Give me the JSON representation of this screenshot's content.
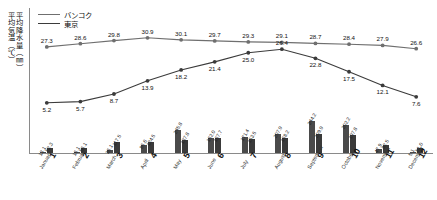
{
  "axis_titles": {
    "temperature": "平均気温（℃）",
    "precipitation": "平均降水量（㎜）"
  },
  "legend": {
    "items": [
      {
        "label": "バンコク",
        "color": "#6f6f6f"
      },
      {
        "label": "東京",
        "color": "#3b3b3b"
      }
    ]
  },
  "chart_data": {
    "type": "line",
    "title": "",
    "xlabel": "",
    "ylabel": "平均気温（℃） / 平均降水量（㎜）",
    "grid": false,
    "legend_position": "top-left",
    "categories": [
      "1",
      "2",
      "3",
      "4",
      "5",
      "6",
      "7",
      "8",
      "9",
      "10",
      "11",
      "12"
    ],
    "month_names": [
      "January",
      "February",
      "March",
      "April",
      "May",
      "June",
      "July",
      "August",
      "September",
      "October",
      "November",
      "December"
    ],
    "ylim_temperature": [
      0,
      35
    ],
    "ylim_precipitation": [
      0,
      360
    ],
    "series": [
      {
        "name": "バンコク",
        "kind": "line",
        "measure": "temperature",
        "unit": "℃",
        "color": "#6f6f6f",
        "values": [
          27.3,
          28.6,
          29.8,
          30.9,
          30.1,
          29.7,
          29.3,
          29.1,
          28.7,
          28.4,
          27.9,
          26.6
        ]
      },
      {
        "name": "東京",
        "kind": "line",
        "measure": "temperature",
        "unit": "℃",
        "color": "#3b3b3b",
        "values": [
          5.2,
          5.7,
          8.7,
          13.9,
          18.2,
          21.4,
          25.0,
          26.4,
          22.8,
          17.5,
          12.1,
          7.6
        ]
      },
      {
        "name": "バンコク",
        "kind": "bar",
        "measure": "precipitation",
        "unit": "㎜",
        "color": "#4a4a4a",
        "values": [
          13.1,
          16.1,
          36.1,
          86.6,
          245.8,
          162.0,
          171.4,
          207.9,
          344.2,
          302.2,
          47.9,
          5.1
        ]
      },
      {
        "name": "東京",
        "kind": "bar",
        "measure": "precipitation",
        "unit": "㎜",
        "color": "#3a3a3a",
        "values": [
          52.3,
          56.1,
          117.5,
          124.5,
          137.8,
          167.7,
          153.5,
          168.2,
          209.9,
          197.8,
          92.5,
          51.0
        ]
      }
    ]
  }
}
